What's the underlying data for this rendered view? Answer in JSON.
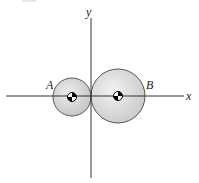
{
  "diagram": {
    "axes": {
      "x_label": "x",
      "y_label": "y",
      "origin": [
        91,
        96
      ]
    },
    "spheres": [
      {
        "label": "A",
        "cx": 72,
        "cy": 97,
        "r": 19,
        "fill": "#d6d6d6",
        "stroke": "#555555"
      },
      {
        "label": "B",
        "cx": 118,
        "cy": 96,
        "r": 27,
        "fill": "#dcdcdc",
        "stroke": "#555555"
      }
    ],
    "center_of_mass_marker": "quartered-circle",
    "colors": {
      "axis": "#333333",
      "marker_dark": "#000000",
      "marker_light": "#ffffff"
    }
  }
}
